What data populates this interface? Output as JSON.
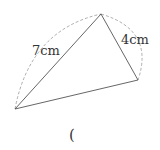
{
  "diagram": {
    "type": "triangle-with-arcs",
    "vertices": {
      "top": [
        101,
        14
      ],
      "right": [
        138,
        80
      ],
      "left": [
        15,
        109
      ]
    },
    "labels": {
      "side_left_top": "7cm",
      "side_top_right": "4cm",
      "answer_paren": "("
    },
    "colors": {
      "line": "#555555",
      "dashed": "#999999",
      "text": "#333333"
    }
  }
}
